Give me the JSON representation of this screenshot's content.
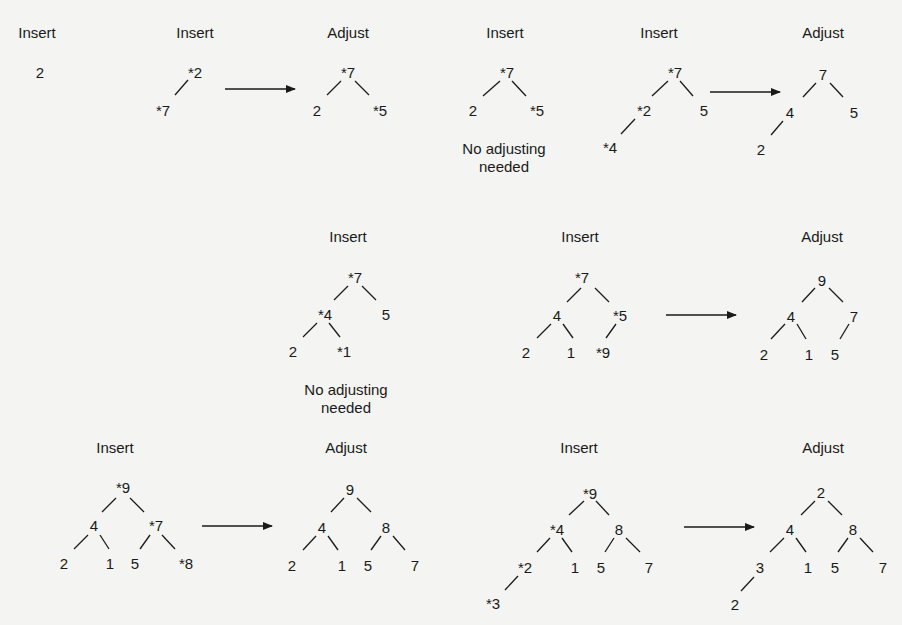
{
  "figure": {
    "marker_note": "* marks nodes involved in the current insert/adjust",
    "panels": [
      {
        "id": "p1",
        "label": "Insert",
        "label_pos": [
          37,
          37
        ],
        "nodes": [
          {
            "text": "2",
            "x": 40,
            "y": 72
          }
        ],
        "edges": []
      },
      {
        "id": "p2",
        "label": "Insert",
        "label_pos": [
          195,
          37
        ],
        "nodes": [
          {
            "text": "*2",
            "x": 195,
            "y": 72
          },
          {
            "text": "*7",
            "x": 163,
            "y": 110
          }
        ],
        "edges": [
          [
            188,
            80,
            175,
            95
          ]
        ]
      },
      {
        "id": "p3",
        "label": "Adjust",
        "label_pos": [
          348,
          37
        ],
        "nodes": [
          {
            "text": "*7",
            "x": 348,
            "y": 72
          },
          {
            "text": "2",
            "x": 317,
            "y": 110
          },
          {
            "text": "*5",
            "x": 380,
            "y": 110
          }
        ],
        "edges": [
          [
            341,
            81,
            327,
            95
          ],
          [
            355,
            81,
            369,
            95
          ]
        ]
      },
      {
        "id": "p4",
        "label": "Insert",
        "label_pos": [
          505,
          37
        ],
        "nodes": [
          {
            "text": "*7",
            "x": 507,
            "y": 72
          },
          {
            "text": "2",
            "x": 473,
            "y": 110
          },
          {
            "text": "*5",
            "x": 537,
            "y": 110
          }
        ],
        "edges": [
          [
            500,
            81,
            483,
            96
          ],
          [
            512,
            81,
            526,
            96
          ]
        ],
        "note_lines": [
          "No adjusting",
          "needed"
        ],
        "note_pos": [
          504,
          140
        ]
      },
      {
        "id": "p5",
        "label": "Insert",
        "label_pos": [
          659,
          37
        ],
        "nodes": [
          {
            "text": "*7",
            "x": 675,
            "y": 72
          },
          {
            "text": "*2",
            "x": 644,
            "y": 110
          },
          {
            "text": "5",
            "x": 704,
            "y": 110
          },
          {
            "text": "*4",
            "x": 610,
            "y": 147
          }
        ],
        "edges": [
          [
            668,
            81,
            652,
            96
          ],
          [
            680,
            81,
            693,
            96
          ],
          [
            635,
            119,
            621,
            134
          ]
        ]
      },
      {
        "id": "p6",
        "label": "Adjust",
        "label_pos": [
          823,
          37
        ],
        "nodes": [
          {
            "text": "7",
            "x": 823,
            "y": 74
          },
          {
            "text": "4",
            "x": 790,
            "y": 112
          },
          {
            "text": "5",
            "x": 854,
            "y": 112
          },
          {
            "text": "2",
            "x": 761,
            "y": 149
          }
        ],
        "edges": [
          [
            816,
            83,
            803,
            97
          ],
          [
            830,
            83,
            843,
            97
          ],
          [
            783,
            121,
            771,
            135
          ]
        ]
      },
      {
        "id": "p7",
        "label": "Insert",
        "label_pos": [
          348,
          241
        ],
        "nodes": [
          {
            "text": "*7",
            "x": 355,
            "y": 277
          },
          {
            "text": "*4",
            "x": 325,
            "y": 314
          },
          {
            "text": "5",
            "x": 386,
            "y": 314
          },
          {
            "text": "2",
            "x": 293,
            "y": 351
          },
          {
            "text": "*1",
            "x": 344,
            "y": 351
          }
        ],
        "edges": [
          [
            348,
            286,
            334,
            300
          ],
          [
            362,
            286,
            376,
            300
          ],
          [
            317,
            323,
            303,
            337
          ],
          [
            329,
            323,
            340,
            337
          ]
        ],
        "note_lines": [
          "No adjusting",
          "needed"
        ],
        "note_pos": [
          346,
          381
        ]
      },
      {
        "id": "p8",
        "label": "Insert",
        "label_pos": [
          580,
          241
        ],
        "nodes": [
          {
            "text": "*7",
            "x": 582,
            "y": 277
          },
          {
            "text": "4",
            "x": 557,
            "y": 315
          },
          {
            "text": "*5",
            "x": 620,
            "y": 315
          },
          {
            "text": "2",
            "x": 526,
            "y": 352
          },
          {
            "text": "1",
            "x": 571,
            "y": 352
          },
          {
            "text": "*9",
            "x": 603,
            "y": 352
          }
        ],
        "edges": [
          [
            581,
            288,
            567,
            302
          ],
          [
            595,
            288,
            609,
            302
          ],
          [
            551,
            324,
            537,
            338
          ],
          [
            563,
            324,
            573,
            338
          ],
          [
            616,
            324,
            606,
            338
          ]
        ]
      },
      {
        "id": "p9",
        "label": "Adjust",
        "label_pos": [
          822,
          241
        ],
        "nodes": [
          {
            "text": "9",
            "x": 822,
            "y": 280
          },
          {
            "text": "4",
            "x": 791,
            "y": 316
          },
          {
            "text": "7",
            "x": 854,
            "y": 316
          },
          {
            "text": "2",
            "x": 764,
            "y": 354
          },
          {
            "text": "1",
            "x": 809,
            "y": 354
          },
          {
            "text": "5",
            "x": 835,
            "y": 354
          }
        ],
        "edges": [
          [
            815,
            288,
            802,
            302
          ],
          [
            829,
            288,
            843,
            302
          ],
          [
            785,
            324,
            771,
            339
          ],
          [
            797,
            324,
            806,
            339
          ],
          [
            849,
            324,
            840,
            339
          ]
        ]
      },
      {
        "id": "p10",
        "label": "Insert",
        "label_pos": [
          115,
          452
        ],
        "nodes": [
          {
            "text": "*9",
            "x": 123,
            "y": 487
          },
          {
            "text": "4",
            "x": 94,
            "y": 525
          },
          {
            "text": "*7",
            "x": 156,
            "y": 525
          },
          {
            "text": "2",
            "x": 64,
            "y": 563
          },
          {
            "text": "1",
            "x": 110,
            "y": 563
          },
          {
            "text": "5",
            "x": 135,
            "y": 563
          },
          {
            "text": "*8",
            "x": 186,
            "y": 563
          }
        ],
        "edges": [
          [
            116,
            498,
            102,
            512
          ],
          [
            130,
            498,
            144,
            512
          ],
          [
            88,
            535,
            74,
            549
          ],
          [
            100,
            535,
            109,
            549
          ],
          [
            150,
            535,
            140,
            549
          ],
          [
            162,
            535,
            175,
            549
          ]
        ]
      },
      {
        "id": "p11",
        "label": "Adjust",
        "label_pos": [
          346,
          452
        ],
        "nodes": [
          {
            "text": "9",
            "x": 350,
            "y": 489
          },
          {
            "text": "4",
            "x": 322,
            "y": 527
          },
          {
            "text": "8",
            "x": 386,
            "y": 527
          },
          {
            "text": "2",
            "x": 292,
            "y": 565
          },
          {
            "text": "1",
            "x": 342,
            "y": 565
          },
          {
            "text": "5",
            "x": 368,
            "y": 565
          },
          {
            "text": "7",
            "x": 415,
            "y": 565
          }
        ],
        "edges": [
          [
            344,
            498,
            331,
            512
          ],
          [
            357,
            498,
            371,
            512
          ],
          [
            316,
            536,
            303,
            550
          ],
          [
            328,
            536,
            338,
            550
          ],
          [
            381,
            536,
            371,
            550
          ],
          [
            393,
            536,
            405,
            550
          ]
        ]
      },
      {
        "id": "p12",
        "label": "Insert",
        "label_pos": [
          579,
          452
        ],
        "nodes": [
          {
            "text": "*9",
            "x": 590,
            "y": 493
          },
          {
            "text": "*4",
            "x": 557,
            "y": 529
          },
          {
            "text": "8",
            "x": 619,
            "y": 529
          },
          {
            "text": "*2",
            "x": 525,
            "y": 567
          },
          {
            "text": "1",
            "x": 575,
            "y": 567
          },
          {
            "text": "5",
            "x": 601,
            "y": 567
          },
          {
            "text": "7",
            "x": 649,
            "y": 567
          },
          {
            "text": "*3",
            "x": 493,
            "y": 603
          }
        ],
        "edges": [
          [
            584,
            501,
            569,
            515
          ],
          [
            596,
            501,
            609,
            515
          ],
          [
            550,
            538,
            537,
            552
          ],
          [
            562,
            538,
            572,
            552
          ],
          [
            614,
            538,
            605,
            552
          ],
          [
            626,
            538,
            640,
            552
          ],
          [
            518,
            576,
            505,
            590
          ]
        ]
      },
      {
        "id": "p13",
        "label": "Adjust",
        "label_pos": [
          823,
          452
        ],
        "nodes": [
          {
            "text": "2",
            "x": 821,
            "y": 492
          },
          {
            "text": "4",
            "x": 790,
            "y": 529
          },
          {
            "text": "8",
            "x": 853,
            "y": 529
          },
          {
            "text": "3",
            "x": 760,
            "y": 567
          },
          {
            "text": "1",
            "x": 808,
            "y": 567
          },
          {
            "text": "5",
            "x": 835,
            "y": 567
          },
          {
            "text": "7",
            "x": 883,
            "y": 567
          },
          {
            "text": "2",
            "x": 735,
            "y": 604
          }
        ],
        "edges": [
          [
            815,
            501,
            801,
            515
          ],
          [
            828,
            501,
            842,
            515
          ],
          [
            784,
            538,
            770,
            552
          ],
          [
            796,
            538,
            806,
            552
          ],
          [
            848,
            538,
            838,
            552
          ],
          [
            860,
            538,
            873,
            552
          ],
          [
            754,
            577,
            741,
            591
          ]
        ]
      }
    ],
    "arrows": [
      {
        "id": "a1",
        "x1": 225,
        "y1": 89,
        "x2": 295,
        "y2": 89
      },
      {
        "id": "a2",
        "x1": 710,
        "y1": 92,
        "x2": 780,
        "y2": 92
      },
      {
        "id": "a3",
        "x1": 666,
        "y1": 315,
        "x2": 736,
        "y2": 315
      },
      {
        "id": "a4",
        "x1": 202,
        "y1": 526,
        "x2": 272,
        "y2": 526
      },
      {
        "id": "a5",
        "x1": 684,
        "y1": 527,
        "x2": 754,
        "y2": 527
      }
    ]
  }
}
